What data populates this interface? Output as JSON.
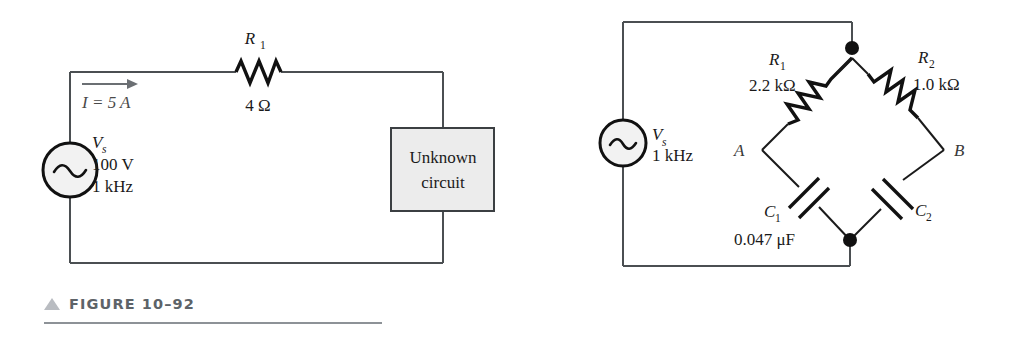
{
  "page": {
    "background": "#ffffff",
    "width": 1013,
    "height": 348
  },
  "figures": [
    {
      "id": "figure-10-92",
      "caption_number": "FIGURE 10–92",
      "caption_marker": "triangle-up-icon",
      "title": "Series circuit with unknown load",
      "source": {
        "type": "ac-voltage-source",
        "label": "V",
        "label_sub": "s",
        "voltage": "100 V",
        "frequency": "1 kHz"
      },
      "current": {
        "label": "I = 5 A",
        "direction": "right"
      },
      "resistor": {
        "label": "R",
        "label_sub": "1",
        "value": "4 Ω"
      },
      "load_box": {
        "line1": "Unknown",
        "line2": "circuit",
        "fill": "#ececec"
      }
    },
    {
      "id": "figure-10-93",
      "caption_number": "FIGURE 10–93",
      "caption_marker": "triangle-up-icon",
      "title": "AC bridge circuit",
      "source": {
        "type": "ac-voltage-source",
        "label": "V",
        "label_sub": "s",
        "frequency": "1 kHz"
      },
      "components": [
        {
          "ref": "R",
          "ref_sub": "1",
          "value": "2.2 kΩ",
          "kind": "resistor",
          "branch": "top-left"
        },
        {
          "ref": "R",
          "ref_sub": "2",
          "value": "1.0 kΩ",
          "kind": "resistor",
          "branch": "top-right"
        },
        {
          "ref": "C",
          "ref_sub": "1",
          "value": "0.047 μF",
          "kind": "capacitor",
          "branch": "bottom-left"
        },
        {
          "ref": "C",
          "ref_sub": "2",
          "value": "",
          "kind": "capacitor",
          "branch": "bottom-right"
        }
      ],
      "nodes": [
        {
          "name": "A",
          "position": "left"
        },
        {
          "name": "B",
          "position": "right"
        }
      ]
    }
  ]
}
